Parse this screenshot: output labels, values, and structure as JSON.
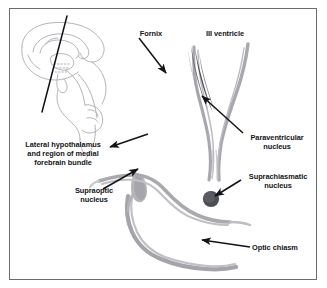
{
  "figure": {
    "border_color": "#6b6b72",
    "background_color": "#ffffff",
    "ink_color": "#141418",
    "structure_color": "#9a9aa0",
    "nucleus_dark_color": "#4a4a52"
  },
  "labels": {
    "fornix": "Fornix",
    "third_ventricle": "III ventricle",
    "lateral_hypothalamus": "Lateral hypothalamus\nand region of medial\nforebrain bundle",
    "supraoptic_nucleus": "Supraoptic\nnucleus",
    "paraventricular_nucleus": "Paraventricular\nnucleus",
    "suprachiasmatic_nucleus": "Suprachiasmatic\nnucleus",
    "optic_chiasm": "Optic chiasm"
  },
  "structures": [
    {
      "name": "sagittal-brain-outline",
      "kind": "outline"
    },
    {
      "name": "section-plane-line",
      "kind": "line"
    },
    {
      "name": "third-ventricle",
      "kind": "band"
    },
    {
      "name": "paraventricular-nucleus",
      "kind": "streak"
    },
    {
      "name": "suprachiasmatic-nucleus",
      "kind": "circle"
    },
    {
      "name": "supraoptic-nucleus",
      "kind": "teardrop"
    },
    {
      "name": "optic-chiasm",
      "kind": "band"
    }
  ],
  "annotations": [
    {
      "name": "fornix-arrow",
      "points_to": "fornix"
    },
    {
      "name": "lateral-hypothalamus-arrow",
      "points_to": "lateral hypothalamus"
    },
    {
      "name": "supraoptic-arrow",
      "points_to": "supraoptic nucleus"
    },
    {
      "name": "paraventricular-arrow",
      "points_to": "paraventricular nucleus"
    },
    {
      "name": "suprachiasmatic-arrow",
      "points_to": "suprachiasmatic nucleus"
    },
    {
      "name": "optic-chiasm-arrow",
      "points_to": "optic chiasm"
    }
  ]
}
